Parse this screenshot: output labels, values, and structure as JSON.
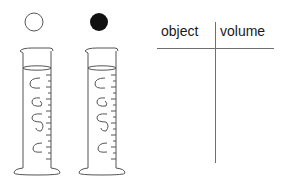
{
  "diagram": {
    "objects": [
      {
        "name": "white-sphere",
        "fill": "#ffffff",
        "stroke": "#555555"
      },
      {
        "name": "black-sphere",
        "fill": "#111111",
        "stroke": "#111111"
      }
    ],
    "cylinders": 2
  },
  "table": {
    "headers": [
      "object",
      "volume"
    ],
    "rows": []
  }
}
